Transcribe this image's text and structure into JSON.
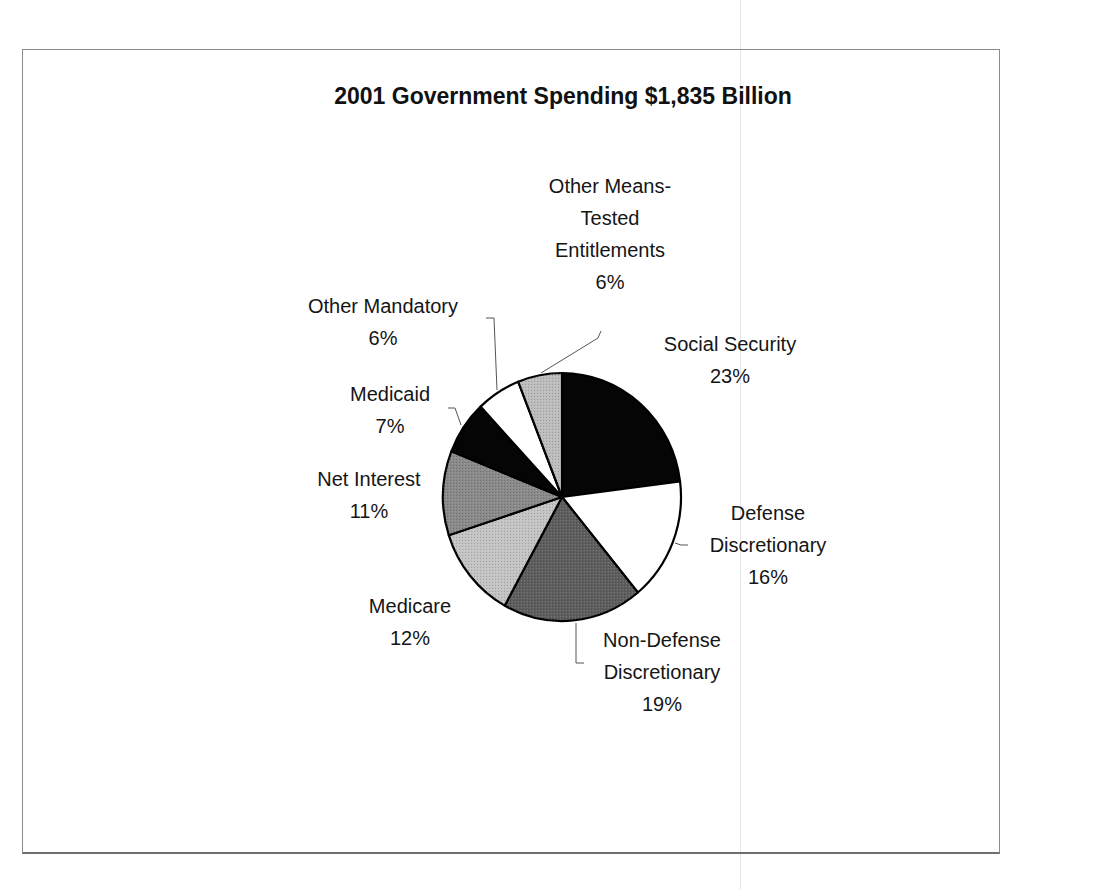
{
  "chart_data": {
    "type": "pie",
    "title": "2001 Government Spending $1,835 Billion",
    "start_angle": "12 o'clock, clockwise",
    "slices": [
      {
        "label": "Social Security",
        "lines": [
          "Social Security"
        ],
        "value": 23,
        "pct": "23%",
        "fill": "#050505"
      },
      {
        "label": "Defense Discretionary",
        "lines": [
          "Defense",
          "Discretionary"
        ],
        "value": 16,
        "pct": "16%",
        "fill": "#ffffff"
      },
      {
        "label": "Non-Defense Discretionary",
        "lines": [
          "Non-Defense",
          "Discretionary"
        ],
        "value": 19,
        "pct": "19%",
        "fill": "#5e5e5e"
      },
      {
        "label": "Medicare",
        "lines": [
          "Medicare"
        ],
        "value": 12,
        "pct": "12%",
        "fill": "#c4c4c4"
      },
      {
        "label": "Net Interest",
        "lines": [
          "Net Interest"
        ],
        "value": 11,
        "pct": "11%",
        "fill": "#8a8a8a"
      },
      {
        "label": "Medicaid",
        "lines": [
          "Medicaid"
        ],
        "value": 7,
        "pct": "7%",
        "fill": "#050505"
      },
      {
        "label": "Other Mandatory",
        "lines": [
          "Other Mandatory"
        ],
        "value": 6,
        "pct": "6%",
        "fill": "#ffffff"
      },
      {
        "label": "Other Means-Tested Entitlements",
        "lines": [
          "Other Means-",
          "Tested",
          "Entitlements"
        ],
        "value": 6,
        "pct": "6%",
        "fill": "#bdbdbd"
      }
    ],
    "legend": "none (data labels with leader lines)",
    "total_label": "$1,835 Billion"
  },
  "labels": {
    "social_security": {
      "l1": "Social Security",
      "pct": "23%"
    },
    "defense": {
      "l1": "Defense",
      "l2": "Discretionary",
      "pct": "16%"
    },
    "nondefense": {
      "l1": "Non-Defense",
      "l2": "Discretionary",
      "pct": "19%"
    },
    "medicare": {
      "l1": "Medicare",
      "pct": "12%"
    },
    "net_interest": {
      "l1": "Net Interest",
      "pct": "11%"
    },
    "medicaid": {
      "l1": "Medicaid",
      "pct": "7%"
    },
    "other_mandatory": {
      "l1": "Other Mandatory",
      "pct": "6%"
    },
    "other_means": {
      "l1": "Other Means-",
      "l2": "Tested",
      "l3": "Entitlements",
      "pct": "6%"
    }
  }
}
